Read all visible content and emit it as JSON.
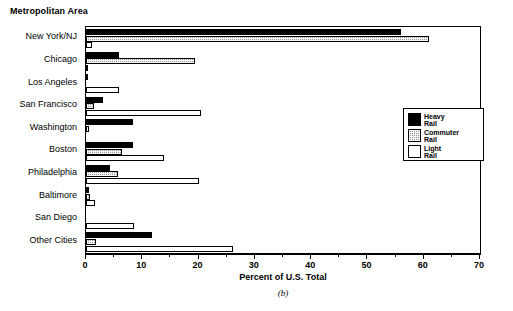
{
  "title": "Metropolitan Area",
  "caption": "(b)",
  "legend": {
    "position": "right-middle",
    "entries": [
      {
        "label_line1": "Heavy",
        "label_line2": "Rail",
        "key": "heavy",
        "color": "#000000"
      },
      {
        "label_line1": "Commuter",
        "label_line2": "Rail",
        "key": "commuter",
        "color": "#9a9a9a"
      },
      {
        "label_line1": "Light",
        "label_line2": "Rail",
        "key": "light",
        "color": "#ffffff"
      }
    ]
  },
  "chart_data": {
    "type": "bar",
    "orientation": "horizontal",
    "title": "Metropolitan Area",
    "xlabel": "Percent of U.S. Total",
    "ylabel": "Metropolitan Area",
    "xlim": [
      0,
      70
    ],
    "xticks": [
      0,
      10,
      20,
      30,
      40,
      50,
      60,
      70
    ],
    "xticklabels": [
      "0",
      "10",
      "20",
      "30",
      "40",
      "50",
      "60",
      "70"
    ],
    "minor_tick_interval": 5,
    "grid": false,
    "legend_position": "right",
    "categories": [
      "New York/NJ",
      "Chicago",
      "Los Angeles",
      "San Francisco",
      "Washington",
      "Boston",
      "Philadelphia",
      "Baltimore",
      "San Diego",
      "Other Cities"
    ],
    "series": [
      {
        "name": "Heavy Rail",
        "key": "heavy",
        "color": "#000000",
        "values": [
          56,
          5.8,
          0.3,
          3.1,
          8.4,
          8.3,
          4.2,
          0.6,
          0,
          11.8
        ]
      },
      {
        "name": "Commuter Rail",
        "key": "commuter",
        "color": "#9a9a9a",
        "values": [
          61,
          19.4,
          0,
          1.4,
          0.5,
          6.4,
          5.7,
          0.7,
          0,
          1.8
        ]
      },
      {
        "name": "Light Rail",
        "key": "light",
        "color": "#ffffff",
        "values": [
          1.0,
          0.2,
          5.9,
          20.4,
          0,
          13.9,
          20.1,
          1.6,
          8.6,
          26.1
        ]
      }
    ]
  }
}
